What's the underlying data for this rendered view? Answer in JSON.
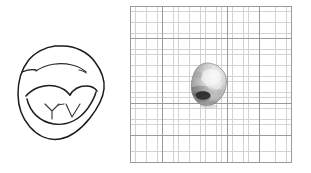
{
  "figure": {
    "background_color": "#ffffff",
    "width": 311,
    "height": 173,
    "panel_count": 2
  },
  "panels": [
    {
      "id": "drawing",
      "name": "line-drawing-panel",
      "caption": "",
      "description": "Hand-drawn ink outline of a rounded, sub-angular rock specimen with interior ridge and facet contour lines",
      "ink_color": "#1a1a1a",
      "fill_color": "#ffffff",
      "stroke_width": 1.4,
      "bounds": {
        "x": 18,
        "y": 46,
        "width": 87,
        "height": 94
      },
      "features": [
        {
          "name": "outer-outline",
          "label": "Specimen outline"
        },
        {
          "name": "upper-ridge-line",
          "label": "Upper ridge contour"
        },
        {
          "name": "median-facet-line",
          "label": "Median facet edge"
        },
        {
          "name": "y-facet-mark",
          "label": "Y-shaped facet junction"
        },
        {
          "name": "v-facet-mark",
          "label": "V-shaped facet junction"
        },
        {
          "name": "lower-rim-line",
          "label": "Lower rim contour"
        }
      ]
    },
    {
      "id": "photo",
      "name": "photograph-panel",
      "caption": "",
      "description": "Grayscale photograph of the rock specimen resting on millimetre graph paper for scale",
      "graph_paper": {
        "name": "graph-paper",
        "minor_cell_px": 5.38,
        "major_cell_px": 32.3,
        "minor_cells_per_major": 6,
        "minor_line_color": "#d2d2d6",
        "major_line_color": "#9a9a9e",
        "paper_color": "#ffffff",
        "columns_major": 5,
        "rows_major": 5,
        "bounds": {
          "x": 130,
          "y": 6,
          "width": 162,
          "height": 157
        }
      },
      "specimen": {
        "name": "rock-specimen",
        "shape": "sub-rounded polygonal pebble",
        "bounds": {
          "x": 190,
          "y": 62,
          "width": 38,
          "height": 46
        },
        "highlight_color": "#f2f2f2",
        "midtone_color": "#b8b8b8",
        "shadow_color": "#6e6e6e",
        "deep_shadow_color": "#222222",
        "outline_color": "#7a7a7a",
        "lighting": "illuminated from upper right, cast shadow lower left"
      }
    }
  ]
}
